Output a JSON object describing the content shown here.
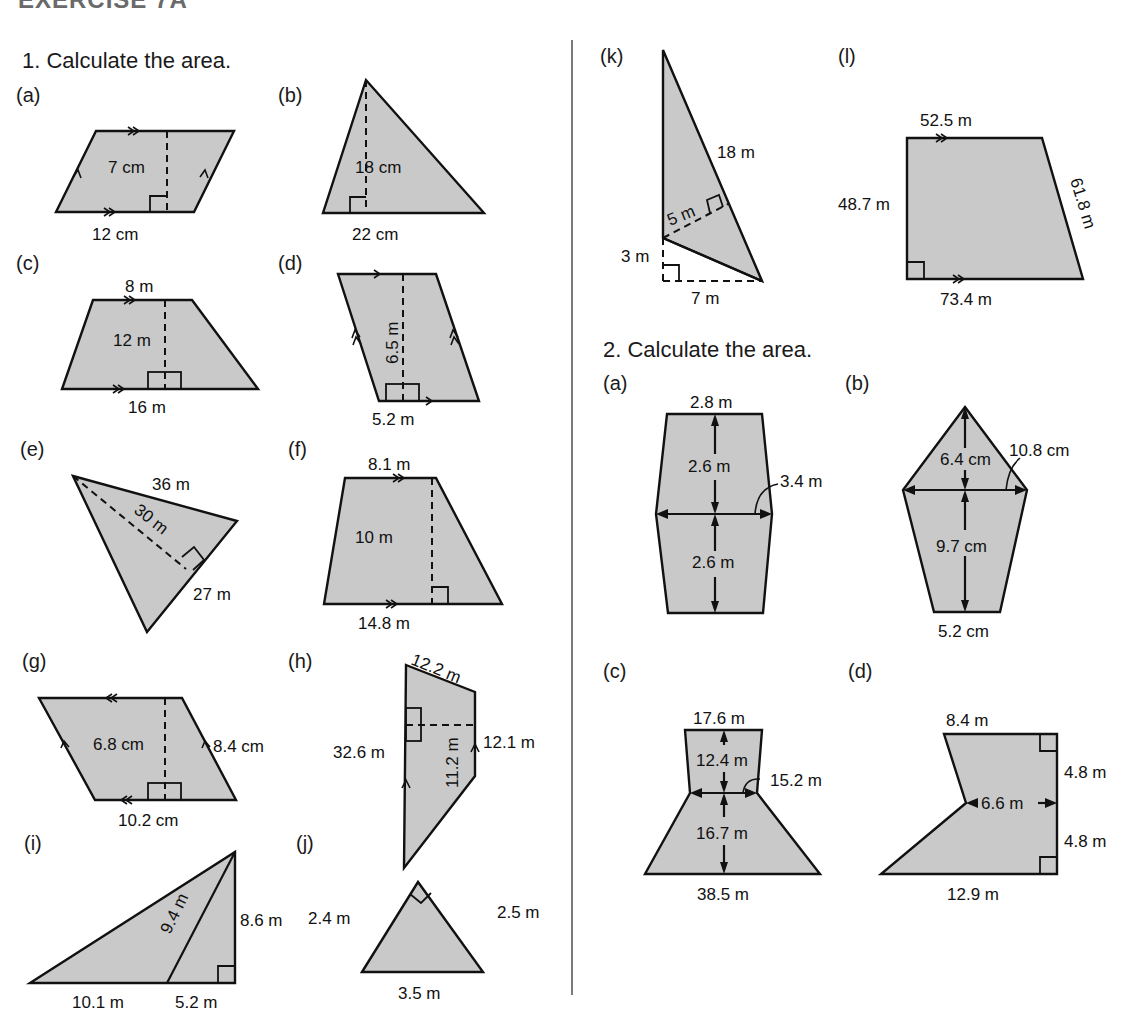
{
  "header": {
    "title": "EXERCISE 7A"
  },
  "q1": {
    "title": "1.  Calculate the area.",
    "parts": {
      "a": {
        "label": "(a)",
        "height": "7 cm",
        "base": "12 cm"
      },
      "b": {
        "label": "(b)",
        "height": "18 cm",
        "base": "22 cm"
      },
      "c": {
        "label": "(c)",
        "top": "8 m",
        "height": "12 m",
        "base": "16 m"
      },
      "d": {
        "label": "(d)",
        "height": "6.5 m",
        "base": "5.2 m"
      },
      "e": {
        "label": "(e)",
        "side1": "36 m",
        "height": "30 m",
        "side2": "27 m"
      },
      "f": {
        "label": "(f)",
        "top": "8.1 m",
        "height": "10 m",
        "base": "14.8 m"
      },
      "g": {
        "label": "(g)",
        "height": "6.8 cm",
        "side": "8.4 cm",
        "base": "10.2 cm"
      },
      "h": {
        "label": "(h)",
        "top": "12.2 m",
        "left": "32.6 m",
        "height": "11.2 m",
        "right": "12.1 m"
      },
      "i": {
        "label": "(i)",
        "slant": "9.4 m",
        "height": "8.6 m",
        "base1": "10.1 m",
        "base2": "5.2 m"
      },
      "j": {
        "label": "(j)",
        "left": "2.4 m",
        "right": "2.5 m",
        "base": "3.5 m"
      },
      "k": {
        "label": "(k)",
        "hyp": "18 m",
        "perp": "5 m",
        "vert": "3 m",
        "base": "7 m"
      },
      "l": {
        "label": "(l)",
        "top": "52.5 m",
        "left": "48.7 m",
        "right": "61.8 m",
        "base": "73.4 m"
      }
    }
  },
  "q2": {
    "title": "2.  Calculate the area.",
    "parts": {
      "a": {
        "label": "(a)",
        "top": "2.8 m",
        "h1": "2.6 m",
        "mid": "3.4 m",
        "h2": "2.6 m"
      },
      "b": {
        "label": "(b)",
        "h1": "6.4 cm",
        "mid": "10.8 cm",
        "h2": "9.7 cm",
        "base": "5.2 cm"
      },
      "c": {
        "label": "(c)",
        "top": "17.6 m",
        "h1": "12.4 m",
        "mid": "15.2 m",
        "h2": "16.7 m",
        "base": "38.5 m"
      },
      "d": {
        "label": "(d)",
        "top": "8.4 m",
        "r1": "4.8 m",
        "mid": "6.6 m",
        "r2": "4.8 m",
        "base": "12.9 m"
      }
    }
  }
}
